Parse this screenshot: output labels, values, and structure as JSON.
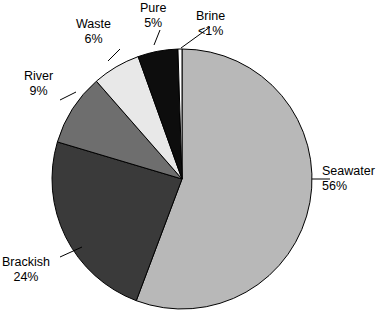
{
  "chart_data": {
    "type": "pie",
    "title": "",
    "subtitle": "",
    "xlabel": "",
    "ylabel": "",
    "legend_position": "none",
    "grid": false,
    "labels_outside": true,
    "start_angle_deg": 0,
    "direction": "clockwise",
    "categories": [
      "Seawater",
      "Brackish",
      "River",
      "Waste",
      "Pure",
      "Brine"
    ],
    "values": [
      56,
      24,
      9,
      6,
      5,
      0.5
    ],
    "value_labels": [
      "56%",
      "24%",
      "9%",
      "6%",
      "5%",
      "<1%"
    ],
    "colors": [
      "#b8b8b8",
      "#3a3a3a",
      "#6e6e6e",
      "#e8e8e8",
      "#0d0d0d",
      "#ffffff"
    ],
    "slices": [
      {
        "name": "Seawater",
        "value": 56,
        "value_label": "56%",
        "color": "#b8b8b8"
      },
      {
        "name": "Brackish",
        "value": 24,
        "value_label": "24%",
        "color": "#3a3a3a"
      },
      {
        "name": "River",
        "value": 9,
        "value_label": "9%",
        "color": "#6e6e6e"
      },
      {
        "name": "Waste",
        "value": 6,
        "value_label": "6%",
        "color": "#e8e8e8"
      },
      {
        "name": "Pure",
        "value": 5,
        "value_label": "5%",
        "color": "#0d0d0d"
      },
      {
        "name": "Brine",
        "value": 0.5,
        "value_label": "<1%",
        "color": "#ffffff"
      }
    ]
  },
  "labels": {
    "seawater": {
      "name": "Seawater",
      "value": "56%"
    },
    "brackish": {
      "name": "Brackish",
      "value": "24%"
    },
    "river": {
      "name": "River",
      "value": "9%"
    },
    "waste": {
      "name": "Waste",
      "value": "6%"
    },
    "pure": {
      "name": "Pure",
      "value": "5%"
    },
    "brine": {
      "name": "Brine",
      "value": "<1%"
    }
  },
  "geometry": {
    "center_x": 182,
    "center_y": 179,
    "radius": 130,
    "stroke_color": "#000000",
    "stroke_width": 1
  }
}
